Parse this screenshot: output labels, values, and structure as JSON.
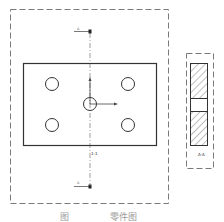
{
  "diagram": {
    "type": "engineering-drawing",
    "views": [
      {
        "name": "front-view",
        "description": "Rectangular plate with four corner holes and a central hole, section cut line A-A"
      },
      {
        "name": "side-section-view",
        "description": "Hatched section view with central hole"
      }
    ],
    "labels": {
      "section_mark_top": "A",
      "section_mark_bottom": "A",
      "center_label": "1:1",
      "side_label": "A-A"
    },
    "colors": {
      "line": "#333333",
      "dashed_border": "#7a7a7a",
      "hatch": "#444444"
    }
  },
  "caption": {
    "figure": "图",
    "title": "零件图"
  }
}
